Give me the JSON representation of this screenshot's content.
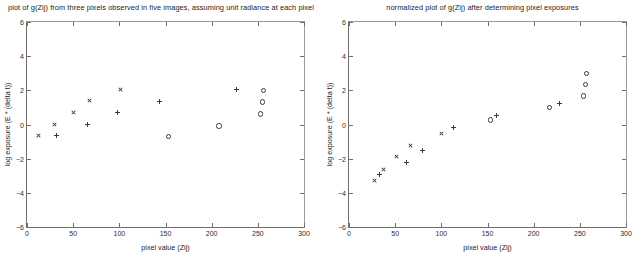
{
  "chart_data": [
    {
      "id": "left",
      "type": "scatter",
      "title": "plot of g(Zij) from three pixels observed in five images, assuming unit radiance at each pixel",
      "xlabel": "pixel value (Zij)",
      "ylabel": "log exposure (E * (delta t))",
      "xlim": [
        0,
        300
      ],
      "ylim": [
        -6,
        6
      ],
      "xticks": [
        0,
        50,
        100,
        150,
        200,
        250,
        300
      ],
      "yticks": [
        -6,
        -4,
        -2,
        0,
        2,
        4,
        6
      ],
      "grid": false,
      "legend": "none",
      "series": [
        {
          "name": "pixel 1",
          "marker": "x",
          "points": [
            [
              12,
              -0.65
            ],
            [
              30,
              -0.02
            ],
            [
              50,
              0.68
            ],
            [
              68,
              1.38
            ],
            [
              101,
              2.05
            ]
          ]
        },
        {
          "name": "pixel 2",
          "marker": "plus",
          "points": [
            [
              32,
              -0.65
            ],
            [
              65,
              -0.02
            ],
            [
              98,
              0.68
            ],
            [
              143,
              1.35
            ],
            [
              227,
              2.05
            ]
          ]
        },
        {
          "name": "pixel 3",
          "marker": "o",
          "points": [
            [
              152,
              -0.65
            ],
            [
              207,
              -0.02
            ],
            [
              252,
              0.68
            ],
            [
              254,
              1.38
            ],
            [
              255,
              2.05
            ]
          ]
        }
      ]
    },
    {
      "id": "right",
      "type": "scatter",
      "title": "normalized plot of g(Zij) after determining pixel exposures",
      "xlabel": "pixel value (Zij)",
      "ylabel": "log exposure (E * (delta t))",
      "xlim": [
        0,
        300
      ],
      "ylim": [
        -6,
        6
      ],
      "xticks": [
        0,
        50,
        100,
        150,
        200,
        250,
        300
      ],
      "yticks": [
        -6,
        -4,
        -2,
        0,
        2,
        4,
        6
      ],
      "grid": false,
      "legend": "none",
      "series": [
        {
          "name": "pixel 1",
          "marker": "x",
          "points": [
            [
              28,
              -3.3
            ],
            [
              37,
              -2.62
            ],
            [
              51,
              -1.9
            ],
            [
              67,
              -1.22
            ],
            [
              100,
              -0.55
            ]
          ]
        },
        {
          "name": "pixel 2",
          "marker": "plus",
          "points": [
            [
              33,
              -2.95
            ],
            [
              62,
              -2.25
            ],
            [
              80,
              -1.55
            ],
            [
              113,
              -0.17
            ],
            [
              160,
              0.5
            ],
            [
              228,
              1.22
            ]
          ]
        },
        {
          "name": "pixel 3",
          "marker": "o",
          "points": [
            [
              152,
              0.33
            ],
            [
              216,
              1.05
            ],
            [
              253,
              1.72
            ],
            [
              255,
              2.4
            ],
            [
              256,
              3.05
            ]
          ]
        }
      ]
    }
  ]
}
